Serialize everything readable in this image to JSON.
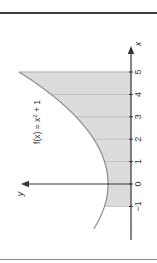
{
  "chart_data": {
    "type": "area",
    "title": "",
    "function_label": "f(x) = x² + 1",
    "function_label_parts": {
      "pre": "f(x) = x",
      "sup": "2",
      "post": " + 1"
    },
    "xlabel": "x",
    "ylabel": "y",
    "orientation": "rotated 90 degrees counterclockwise",
    "x_ticks": [
      -1,
      0,
      1,
      2,
      3,
      4,
      5
    ],
    "x_tick_labels": [
      "−1",
      "0",
      "1",
      "2",
      "3",
      "4",
      "5"
    ],
    "curve_domain": [
      -2,
      5
    ],
    "shaded_interval": [
      -1,
      5
    ],
    "gridlines": "vertical lines at each integer x within shaded region",
    "series": [
      {
        "name": "f(x) = x^2 + 1",
        "x": [
          -2,
          -1,
          0,
          1,
          2,
          3,
          4,
          5
        ],
        "y": [
          5,
          2,
          1,
          2,
          5,
          10,
          17,
          26
        ]
      }
    ],
    "colors": {
      "shade": "#dcdcdc",
      "curve": "#8c8c8c",
      "axis": "#333333",
      "grid": "#b4b4b4"
    }
  }
}
